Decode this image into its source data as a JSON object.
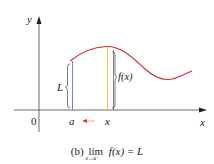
{
  "figure": {
    "axis_labels": {
      "y": "y",
      "x": "x",
      "origin": "0"
    },
    "tick_labels": {
      "a": "a",
      "x": "x"
    },
    "brace_labels": {
      "left": "L",
      "right": "f(x)"
    },
    "caption": {
      "prefix": "(b)",
      "lim": "lim",
      "lim_subscript": "x→a⁺",
      "expression": "f(x) = L"
    },
    "colors": {
      "curve": "#d6282e",
      "line_a": "#5b79c0",
      "line_x": "#f0c040",
      "axis": "#333333",
      "arrow": "#e0303a",
      "brace": "#444444"
    }
  }
}
